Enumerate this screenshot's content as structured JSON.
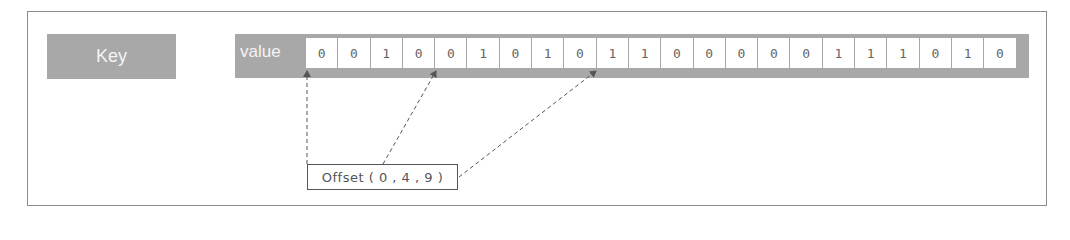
{
  "diagram": {
    "key_label": "Key",
    "value_label": "value",
    "bits": [
      "0",
      "0",
      "1",
      "0",
      "0",
      "1",
      "0",
      "1",
      "0",
      "1",
      "1",
      "0",
      "0",
      "0",
      "0",
      "0",
      "1",
      "1",
      "1",
      "0",
      "1",
      "0"
    ],
    "offset_label": "Offset ( 0 , 4 , 9 )",
    "offsets": [
      0,
      4,
      9
    ],
    "colors": {
      "block_gray": "#a8a8a8",
      "block_text": "#f4f4f4",
      "cell_bg": "#ffffff",
      "cell_text": "#666666",
      "arrow": "#555555",
      "frame_border": "#8c8c8c"
    }
  }
}
